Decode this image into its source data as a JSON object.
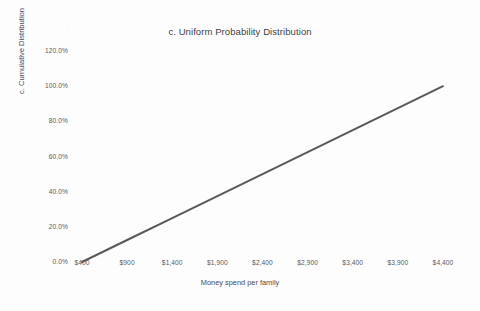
{
  "page": {
    "background_color": "#fdfdfd",
    "clipped_text_above": "...."
  },
  "chart_data": {
    "type": "line",
    "title": "c. Uniform Probability Distribution",
    "xlabel": "Money spend per family",
    "ylabel": "c. Cumulative Distribution",
    "grid": false,
    "legend": "none",
    "line_color": "#595959",
    "line_width_px": 2,
    "x": [
      400,
      4400
    ],
    "values": [
      0,
      100
    ],
    "x_tick_labels": [
      "$400",
      "$900",
      "$1,400",
      "$1,900",
      "$2,400",
      "$2,900",
      "$3,400",
      "$3,900",
      "$4,400"
    ],
    "x_tick_values": [
      400,
      900,
      1400,
      1900,
      2400,
      2900,
      3400,
      3900,
      4400
    ],
    "y_tick_labels": [
      "120.0%",
      "100.0%",
      "80.0%",
      "60.0%",
      "40.0%",
      "20.0%",
      "0.0%"
    ],
    "y_tick_values": [
      120,
      100,
      80,
      60,
      40,
      20,
      0
    ],
    "xlim": [
      400,
      4400
    ],
    "ylim": [
      0,
      120
    ],
    "series": [
      {
        "name": "Cumulative Distribution",
        "points": [
          {
            "x": 400,
            "y": 0
          },
          {
            "x": 900,
            "y": 12.5
          },
          {
            "x": 1400,
            "y": 25
          },
          {
            "x": 1900,
            "y": 37.5
          },
          {
            "x": 2400,
            "y": 50
          },
          {
            "x": 2900,
            "y": 62.5
          },
          {
            "x": 3400,
            "y": 75
          },
          {
            "x": 3900,
            "y": 87.5
          },
          {
            "x": 4400,
            "y": 100
          }
        ]
      }
    ]
  },
  "geometry": {
    "x_pixel_min": 82,
    "x_pixel_max": 443,
    "y_pixel_zero": 262,
    "y_pixel_max": 51,
    "y_value_max": 120,
    "x_value_min": 400,
    "x_value_max": 4400,
    "x_label_row_top": 259
  }
}
